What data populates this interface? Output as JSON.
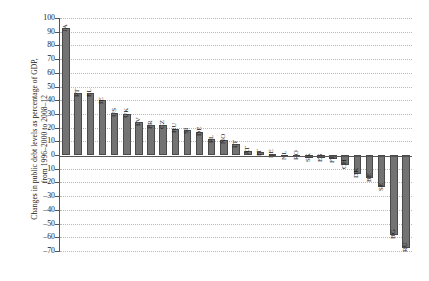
{
  "chart_data": {
    "type": "bar",
    "title": "",
    "xlabel": "",
    "ylabel": "Changes in public debt levels as percentage of GDP,",
    "ylabel_line2": "from 1996–2000 to 2008–12",
    "ylim": [
      -70,
      100
    ],
    "ytick_step": 10,
    "grid": true,
    "legend": "none",
    "bar_color": "#737373",
    "bar_edge_color": "#4a4a4a",
    "yticks": [
      "100",
      "90",
      "80",
      "70",
      "60",
      "50",
      "40",
      "30",
      "20",
      "10",
      "0",
      "–10",
      "–20",
      "–30",
      "–40",
      "–50",
      "–60",
      "–70"
    ],
    "categories": [
      "JA",
      "PT",
      "EL",
      "IE",
      "US",
      "UK",
      "LV",
      "FR",
      "CZ",
      "HU",
      "SI",
      "DE",
      "PL",
      "NO",
      "LT",
      "AT",
      "IT",
      "EE",
      "NL",
      "RO",
      "SK",
      "ES",
      "FI",
      "CH",
      "DK",
      "BE",
      "SE",
      "BG",
      "RU"
    ],
    "values": [
      93,
      45,
      45,
      40,
      31,
      30,
      24,
      22,
      22,
      19,
      18,
      17,
      12,
      11,
      8,
      3,
      2,
      1,
      -1,
      -1,
      -2,
      -2,
      -3,
      -7,
      -14,
      -17,
      -23,
      -58,
      -68
    ]
  }
}
